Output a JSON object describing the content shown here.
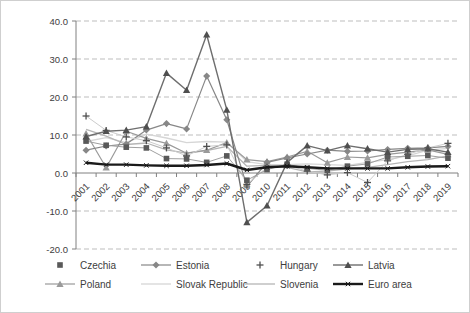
{
  "chart_data": {
    "type": "line",
    "title": "",
    "xlabel": "",
    "ylabel": "",
    "ylim": [
      -20,
      40
    ],
    "grid": "horizontal-dashed",
    "legend_position": "bottom",
    "y_ticks": [
      {
        "value": 40,
        "label": "40.0"
      },
      {
        "value": 30,
        "label": "30.0"
      },
      {
        "value": 20,
        "label": "20.0"
      },
      {
        "value": 10,
        "label": "10.0"
      },
      {
        "value": 0,
        "label": "0.0"
      },
      {
        "value": -10,
        "label": "-10.0"
      },
      {
        "value": -20,
        "label": "-20.0"
      }
    ],
    "categories": [
      "2001",
      "2002",
      "2003",
      "2004",
      "2005",
      "2006",
      "2007",
      "2008",
      "2009",
      "2010",
      "2011",
      "2012",
      "2013",
      "2014",
      "2015",
      "2016",
      "2017",
      "2018",
      "2019"
    ],
    "series": [
      {
        "name": "Czechia",
        "marker": "square",
        "legend_style": "marker-only",
        "color": "#595959",
        "line_color": "#a0a0a0",
        "line_width": 1,
        "values": [
          8.4,
          7.3,
          6.8,
          6.6,
          3.8,
          3.7,
          2.8,
          4.5,
          -1.9,
          0.9,
          2.3,
          1.2,
          0.7,
          1.8,
          2.4,
          4.2,
          4.4,
          4.6,
          3.9
        ]
      },
      {
        "name": "Estonia",
        "marker": "diamond",
        "legend_style": "line-marker",
        "color": "#878787",
        "line_color": "#878787",
        "line_width": 1.2,
        "values": [
          6.0,
          7.1,
          7.6,
          11.3,
          13.0,
          11.6,
          25.5,
          14.0,
          -3.5,
          2.8,
          4.0,
          5.0,
          6.0,
          5.7,
          5.8,
          6.2,
          6.5,
          6.6,
          7.0
        ]
      },
      {
        "name": "Hungary",
        "marker": "plus",
        "legend_style": "marker-only",
        "color": "#4f4f4f",
        "line_color": "#cccccc",
        "line_width": 1,
        "values": [
          15.0,
          11.2,
          9.5,
          8.5,
          6.6,
          4.5,
          7.0,
          7.4,
          -3.0,
          1.5,
          2.0,
          0.5,
          -0.5,
          0.1,
          -2.5,
          3.2,
          4.9,
          6.6,
          7.8
        ]
      },
      {
        "name": "Latvia",
        "marker": "triangle",
        "legend_style": "line-marker",
        "color": "#4f4f4f",
        "line_color": "#6e6e6e",
        "line_width": 1.4,
        "values": [
          9.6,
          11.0,
          11.3,
          12.2,
          26.3,
          21.8,
          36.4,
          16.6,
          -13.0,
          -8.6,
          2.8,
          7.2,
          5.9,
          7.2,
          6.4,
          5.5,
          6.2,
          6.4,
          5.5
        ]
      },
      {
        "name": "Poland",
        "marker": "triangle",
        "legend_style": "line-marker",
        "color": "#9a9a9a",
        "line_color": "#9a9a9a",
        "line_width": 1.2,
        "values": [
          10.4,
          1.4,
          11.0,
          9.1,
          7.8,
          5.2,
          6.0,
          8.0,
          3.5,
          3.0,
          4.2,
          5.7,
          2.7,
          4.2,
          4.0,
          4.9,
          5.5,
          6.1,
          4.9
        ]
      },
      {
        "name": "Slovak Republic",
        "marker": "none",
        "legend_style": "line-only",
        "color": "#d6d6d6",
        "line_color": "#d6d6d6",
        "line_width": 1.3,
        "values": [
          8.3,
          9.3,
          8.0,
          10.2,
          9.2,
          8.0,
          8.3,
          8.1,
          3.0,
          2.2,
          2.2,
          2.4,
          2.2,
          2.0,
          2.8,
          3.5,
          4.5,
          6.0,
          6.5
        ]
      },
      {
        "name": "Slovenia",
        "marker": "none",
        "legend_style": "line-only",
        "color": "#b5b5b5",
        "line_color": "#b5b5b5",
        "line_width": 1.3,
        "values": [
          11.5,
          9.7,
          7.5,
          7.9,
          6.1,
          5.2,
          5.9,
          7.0,
          1.8,
          2.0,
          1.5,
          0.3,
          0.5,
          1.1,
          1.5,
          2.2,
          3.0,
          3.5,
          4.5
        ]
      },
      {
        "name": "Euro area",
        "marker": "xtick",
        "legend_style": "line-marker",
        "color": "#1a1a1a",
        "line_color": "#1a1a1a",
        "line_width": 2.4,
        "values": [
          2.7,
          2.2,
          2.2,
          2.0,
          1.9,
          1.9,
          2.1,
          2.5,
          0.8,
          1.5,
          1.8,
          1.5,
          1.2,
          1.2,
          1.2,
          1.2,
          1.5,
          1.7,
          1.8
        ]
      }
    ],
    "colors": {
      "axis": "#808080",
      "gridline": "#bdbdbd",
      "tick_label": "#3d3d3d"
    }
  }
}
